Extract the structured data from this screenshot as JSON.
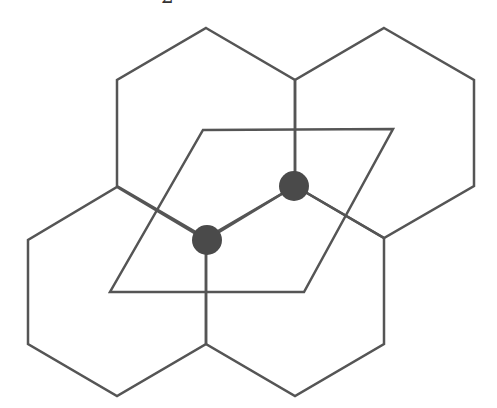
{
  "figure": {
    "clipped_top_label": "2",
    "colors": {
      "background": "#ffffff",
      "line": "#555555",
      "atom": "#4a4a4a"
    },
    "stroke_width": 2.5,
    "hexagons": [
      {
        "name": "hexagon-top-left",
        "points": "206,28 295,80 295,186 206,238 117,186 117,80"
      },
      {
        "name": "hexagon-top-right",
        "points": "384,28 474,80 474,186 384,238 295,186 295,80"
      },
      {
        "name": "hexagon-bottom-left",
        "points": "117,187 206,240 206,344 117,396 28,344 28,240"
      },
      {
        "name": "hexagon-bottom-right",
        "points": "295,186 384,238 384,344 295,396 206,344 206,240"
      }
    ],
    "unit_cell": {
      "name": "unit-cell-parallelogram",
      "points": "203,130 393,129 304,292 110,292"
    },
    "atoms": [
      {
        "name": "atom-a",
        "cx": 294,
        "cy": 186,
        "r": 15
      },
      {
        "name": "atom-b",
        "cx": 207,
        "cy": 240,
        "r": 15
      }
    ]
  }
}
